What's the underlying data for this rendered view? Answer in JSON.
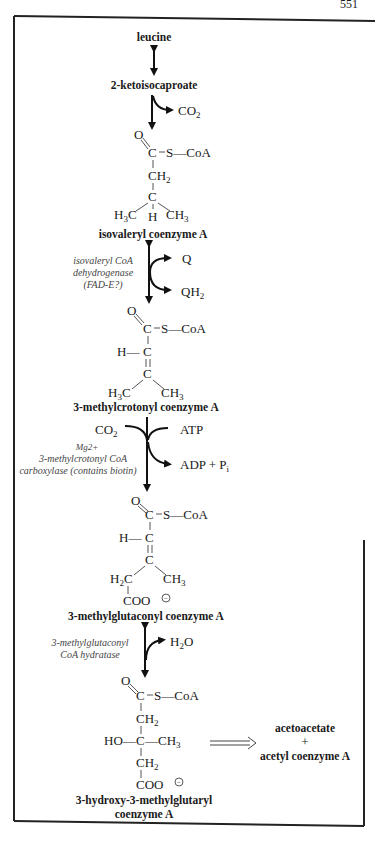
{
  "page_number": "551",
  "pathway": {
    "compounds": {
      "leucine": "leucine",
      "ketoisocaproate": "2-ketoisocaproate",
      "isovaleryl_coa": "isovaleryl coenzyme A",
      "methylcrotonyl_coa": "3-methylcrotonyl coenzyme A",
      "methylglutaconyl_coa": "3-methylglutaconyl coenzyme A",
      "hmg_coa_line1": "3-hydroxy-3-methylglutaryl",
      "hmg_coa_line2": "coenzyme A",
      "products_line1": "acetoacetate",
      "products_plus": "+",
      "products_line2": "acetyl coenzyme A"
    },
    "side_species": {
      "co2_1": "CO",
      "co2_1_sub": "2",
      "q": "Q",
      "qh2": "QH",
      "qh2_sub": "2",
      "co2_2": "CO",
      "co2_2_sub": "2",
      "atp": "ATP",
      "adp": "ADP + P",
      "adp_sub": "i",
      "h2o_pre": "H",
      "h2o_sub": "2",
      "h2o_post": "O"
    },
    "enzymes": {
      "dehydrogenase_line1": "isovaleryl CoA",
      "dehydrogenase_line2": "dehydrogenase",
      "dehydrogenase_line3": "(FAD-E?)",
      "carboxylase_cofactor": "Mg2+",
      "carboxylase_line1": "3-methylcrotonyl CoA",
      "carboxylase_line2": "carboxylase (contains biotin)",
      "hydratase_line1": "3-methylglutaconyl",
      "hydratase_line2": "CoA hydratase"
    },
    "atoms": {
      "O": "O",
      "C": "C",
      "S_CoA": "S—CoA",
      "CH": "CH",
      "two": "2",
      "three": "3",
      "H3C_pre": "H",
      "H3C_post": "C",
      "CH3_pre": "CH",
      "H": "H",
      "H_dash": "H—",
      "H2C_pre": "H",
      "H2C_post": "C",
      "COO": "COO",
      "minus": "−",
      "HO": "HO—",
      "dash_CH3": "—CH"
    }
  }
}
